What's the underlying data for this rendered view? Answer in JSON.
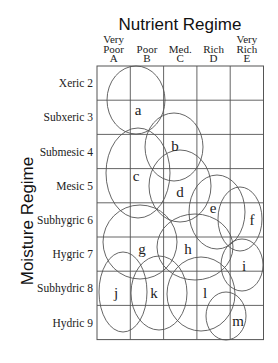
{
  "title": "Nutrient Regime",
  "y_axis_title": "Moisture Regime",
  "columns": [
    {
      "lines": [
        "Very",
        "Poor",
        "A"
      ]
    },
    {
      "lines": [
        "Poor",
        "B"
      ]
    },
    {
      "lines": [
        "Med.",
        "C"
      ]
    },
    {
      "lines": [
        "Rich",
        "D"
      ]
    },
    {
      "lines": [
        "Very",
        "Rich",
        "E"
      ]
    }
  ],
  "rows": [
    {
      "label": "Xeric 2"
    },
    {
      "label": "Subxeric 3"
    },
    {
      "label": "Submesic 4"
    },
    {
      "label": "Mesic 5"
    },
    {
      "label": "Subhygric 6"
    },
    {
      "label": "Hygric 7"
    },
    {
      "label": "Subhydric 8"
    },
    {
      "label": "Hydric 9"
    }
  ],
  "ellipses": [
    {
      "id": "a",
      "label": "a",
      "cx": 136,
      "cy": 100,
      "rx": 29,
      "ry": 34,
      "lx": 138,
      "ly": 115
    },
    {
      "id": "b",
      "label": "b",
      "cx": 174,
      "cy": 147,
      "rx": 29,
      "ry": 34,
      "lx": 175,
      "ly": 151
    },
    {
      "id": "c",
      "label": "c",
      "cx": 138,
      "cy": 173,
      "rx": 32,
      "ry": 45,
      "lx": 136,
      "ly": 181
    },
    {
      "id": "d",
      "label": "d",
      "cx": 180,
      "cy": 186,
      "rx": 31,
      "ry": 36,
      "lx": 180,
      "ly": 197
    },
    {
      "id": "e",
      "label": "e",
      "cx": 217,
      "cy": 212,
      "rx": 28,
      "ry": 37,
      "lx": 213,
      "ly": 213
    },
    {
      "id": "f",
      "label": "f",
      "cx": 240,
      "cy": 219,
      "rx": 22,
      "ry": 32,
      "lx": 252,
      "ly": 225
    },
    {
      "id": "g",
      "label": "g",
      "cx": 140,
      "cy": 242,
      "rx": 37,
      "ry": 37,
      "lx": 142,
      "ly": 254
    },
    {
      "id": "h",
      "label": "h",
      "cx": 195,
      "cy": 247,
      "rx": 38,
      "ry": 33,
      "lx": 188,
      "ly": 254
    },
    {
      "id": "i",
      "label": "i",
      "cx": 242,
      "cy": 265,
      "rx": 21,
      "ry": 26,
      "lx": 244,
      "ly": 271
    },
    {
      "id": "j",
      "label": "j",
      "cx": 123,
      "cy": 292,
      "rx": 24,
      "ry": 40,
      "lx": 116,
      "ly": 298
    },
    {
      "id": "k",
      "label": "k",
      "cx": 159,
      "cy": 293,
      "rx": 28,
      "ry": 37,
      "lx": 154,
      "ly": 298
    },
    {
      "id": "l",
      "label": "l",
      "cx": 201,
      "cy": 294,
      "rx": 34,
      "ry": 37,
      "lx": 205,
      "ly": 298
    },
    {
      "id": "m",
      "label": "m",
      "cx": 226,
      "cy": 316,
      "rx": 20,
      "ry": 24,
      "lx": 238,
      "ly": 326
    }
  ],
  "grid": {
    "x0": 97,
    "y0": 66,
    "col_w": 33.3,
    "row_h": 34.2,
    "cols": 5,
    "rows": 8
  },
  "colors": {
    "line": "#555555",
    "text": "#222222",
    "background": "#ffffff"
  }
}
